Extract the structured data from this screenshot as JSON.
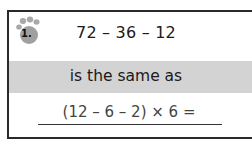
{
  "question": {
    "number": "1.",
    "problem": "72 – 36 – 12",
    "connector": "is the same as",
    "expression": "(12 – 6 – 2) × 6 =",
    "answer": ""
  },
  "colors": {
    "band": "#d3d3d3",
    "paw": "#a0a0a0",
    "border": "#2a2a2a"
  }
}
